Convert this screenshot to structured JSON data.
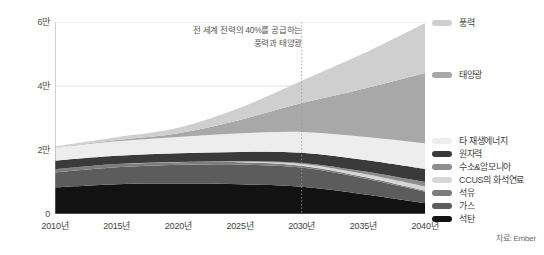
{
  "chart_data": {
    "type": "area",
    "stacked": true,
    "title": "",
    "subtitle": "",
    "xlabel": "",
    "ylabel": "",
    "source": "자료: Ember",
    "grid": true,
    "legend_position": "right",
    "x": [
      2010,
      2015,
      2020,
      2025,
      2030,
      2035,
      2040
    ],
    "xtick_labels": [
      "2010년",
      "2015년",
      "2020년",
      "2025년",
      "2030년",
      "2035년",
      "2040년"
    ],
    "xlim": [
      2010,
      2040
    ],
    "ylim": [
      0,
      60000
    ],
    "ytick_values": [
      0,
      20000,
      40000,
      60000
    ],
    "ytick_labels": [
      "0",
      "2만",
      "4만",
      "6만"
    ],
    "annotation": {
      "line1": "전 세계 전력의 40%를 공급하는",
      "line2": "풍력과 태양광",
      "marker_x": 2030
    },
    "series": [
      {
        "name": "석탄",
        "color": "#121212",
        "values": [
          8300,
          9300,
          9500,
          9300,
          8500,
          6200,
          3400
        ]
      },
      {
        "name": "가스",
        "color": "#5c5c5c",
        "values": [
          4700,
          5300,
          5900,
          6200,
          6000,
          5000,
          3600
        ]
      },
      {
        "name": "석유",
        "color": "#7d7d7d",
        "values": [
          1000,
          1000,
          800,
          700,
          600,
          450,
          300
        ]
      },
      {
        "name": "CCUS의 화석연료",
        "color": "#d6d6d6",
        "values": [
          0,
          0,
          50,
          200,
          500,
          900,
          1300
        ]
      },
      {
        "name": "수소&암모니아",
        "color": "#8e8e8e",
        "values": [
          0,
          0,
          0,
          100,
          350,
          800,
          1400
        ]
      },
      {
        "name": "원자력",
        "color": "#3a3a3a",
        "values": [
          2700,
          2600,
          2700,
          2900,
          3200,
          3600,
          4100
        ]
      },
      {
        "name": "타 재생에너지",
        "color": "#ededed",
        "values": [
          4000,
          4500,
          5100,
          5800,
          6500,
          7200,
          8000
        ]
      },
      {
        "name": "태양광",
        "color": "#a8a8a8",
        "values": [
          50,
          400,
          1200,
          4200,
          9000,
          15000,
          22000
        ]
      },
      {
        "name": "풍력",
        "color": "#cfcfcf",
        "values": [
          350,
          900,
          1700,
          3800,
          7000,
          11000,
          15500
        ]
      }
    ]
  },
  "legend": {
    "top": [
      {
        "label": "풍력",
        "color": "#cfcfcf"
      }
    ],
    "solar": [
      {
        "label": "태양광",
        "color": "#a8a8a8"
      }
    ],
    "bottom": [
      {
        "label": "타 재생에너지",
        "color": "#ededed"
      },
      {
        "label": "원자력",
        "color": "#3a3a3a"
      },
      {
        "label": "수소&암모니아",
        "color": "#8e8e8e"
      },
      {
        "label": "CCUS의 화석연료",
        "color": "#d6d6d6"
      },
      {
        "label": "석유",
        "color": "#7d7d7d"
      },
      {
        "label": "가스",
        "color": "#5c5c5c"
      },
      {
        "label": "석탄",
        "color": "#121212"
      }
    ]
  }
}
